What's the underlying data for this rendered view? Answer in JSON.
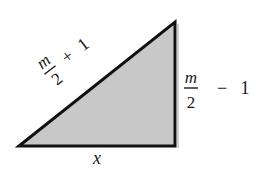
{
  "diagram": {
    "type": "right-triangle",
    "fill_color": "#c8c8c8",
    "stroke_color": "#111111",
    "vertices": {
      "bottom_left": [
        19,
        146
      ],
      "top_right": [
        175,
        22
      ],
      "bottom_right": [
        175,
        146
      ]
    },
    "labels": {
      "hypotenuse": {
        "numerator": "m",
        "denominator": "2",
        "operator": "+",
        "constant": "1"
      },
      "vertical_leg": {
        "numerator": "m",
        "denominator": "2",
        "operator": "−",
        "constant": "1"
      },
      "base": {
        "text": "x"
      }
    }
  }
}
